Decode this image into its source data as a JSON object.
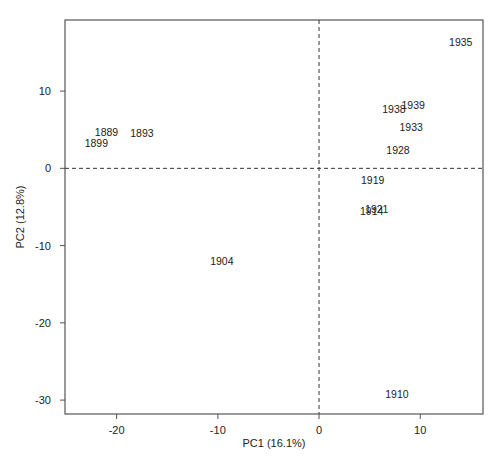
{
  "chart_data": {
    "type": "scatter",
    "title": "",
    "xlabel": "PC1 (16.1%)",
    "ylabel": "PC2 (12.8%)",
    "xlim": [
      -25.1,
      16.2
    ],
    "ylim": [
      -31.8,
      19.2
    ],
    "xticks": [
      -20,
      -10,
      0,
      10
    ],
    "yticks": [
      -30,
      -20,
      -10,
      0,
      10
    ],
    "xtick_labels": [
      "-20",
      "-10",
      "0",
      "10"
    ],
    "ytick_labels": [
      "-30",
      "-20",
      "-10",
      "0",
      "10"
    ],
    "grid": false,
    "reference_lines": {
      "x": 0,
      "y": 0,
      "style": "dashed"
    },
    "legend": null,
    "marker": "text-label",
    "points": [
      {
        "label": "1889",
        "x": -21.0,
        "y": 4.7
      },
      {
        "label": "1893",
        "x": -17.5,
        "y": 4.6
      },
      {
        "label": "1899",
        "x": -22.0,
        "y": 3.3
      },
      {
        "label": "1904",
        "x": -9.6,
        "y": -12.0
      },
      {
        "label": "1910",
        "x": 7.7,
        "y": -29.2
      },
      {
        "label": "1914",
        "x": 5.2,
        "y": -5.5
      },
      {
        "label": "1919",
        "x": 5.3,
        "y": -1.5
      },
      {
        "label": "1921",
        "x": 5.7,
        "y": -5.2
      },
      {
        "label": "1928",
        "x": 7.8,
        "y": 2.4
      },
      {
        "label": "1933",
        "x": 9.1,
        "y": 5.4
      },
      {
        "label": "1935",
        "x": 14.0,
        "y": 16.4
      },
      {
        "label": "1938",
        "x": 7.4,
        "y": 7.7
      },
      {
        "label": "1939",
        "x": 9.3,
        "y": 8.2
      }
    ]
  },
  "colors": {
    "frame": "#555555",
    "text": "#222222",
    "reference_line": "#333333",
    "background": "#ffffff"
  }
}
